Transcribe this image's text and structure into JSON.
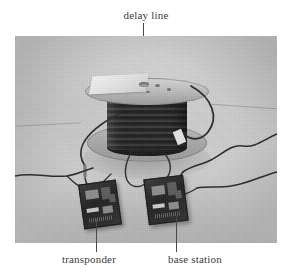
{
  "figure": {
    "type": "photograph",
    "rendering": "grayscale"
  },
  "labels": {
    "delay_line": "delay line",
    "transponder": "transponder",
    "base_station": "base station"
  },
  "colors": {
    "page_background": "#ffffff",
    "label_text": "#3a3a3a",
    "leader_line": "#4a4a4a",
    "photo_floor": "#c8c8c8",
    "spool_coil": "#1e1e1e",
    "spool_flange": "#b9b9b9",
    "circuit_board": "#2b2b2b"
  },
  "photo": {
    "left": 15,
    "top": 36,
    "width": 262,
    "height": 207
  },
  "components": {
    "spool": "delay-line-cable-spool",
    "left_board": "transponder-circuit-board",
    "right_board": "base-station-circuit-board"
  }
}
